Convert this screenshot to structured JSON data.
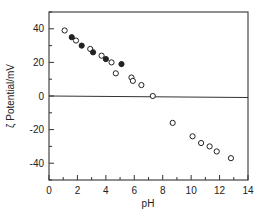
{
  "chart_data": {
    "type": "scatter",
    "title": "",
    "xlabel": "pH",
    "ylabel": "ζ Potential/mV",
    "xlim": [
      0,
      14
    ],
    "ylim": [
      -50,
      50
    ],
    "xticks": [
      0,
      2,
      4,
      6,
      8,
      10,
      12,
      14
    ],
    "yticks": [
      -40,
      -20,
      0,
      20,
      40
    ],
    "x_minor_step": 1,
    "y_minor_step": 10,
    "grid": false,
    "reference_line": {
      "y": 0
    },
    "legend": null,
    "series": [
      {
        "name": "open circles",
        "marker": "open-circle",
        "points": [
          {
            "x": 1.1,
            "y": 39
          },
          {
            "x": 1.9,
            "y": 33
          },
          {
            "x": 2.9,
            "y": 28
          },
          {
            "x": 3.7,
            "y": 24
          },
          {
            "x": 4.4,
            "y": 20
          },
          {
            "x": 4.7,
            "y": 13.5
          },
          {
            "x": 5.8,
            "y": 11
          },
          {
            "x": 5.9,
            "y": 9
          },
          {
            "x": 6.5,
            "y": 6.5
          },
          {
            "x": 7.3,
            "y": 0
          },
          {
            "x": 8.7,
            "y": -16
          },
          {
            "x": 10.1,
            "y": -24
          },
          {
            "x": 10.7,
            "y": -28
          },
          {
            "x": 11.3,
            "y": -30
          },
          {
            "x": 11.8,
            "y": -33
          },
          {
            "x": 12.8,
            "y": -37
          }
        ]
      },
      {
        "name": "filled circles",
        "marker": "filled-circle",
        "points": [
          {
            "x": 1.6,
            "y": 35
          },
          {
            "x": 2.3,
            "y": 30
          },
          {
            "x": 3.1,
            "y": 26
          },
          {
            "x": 4.0,
            "y": 22
          },
          {
            "x": 5.1,
            "y": 19
          }
        ]
      }
    ]
  },
  "colors": {
    "axis": "#333333",
    "marker": "#222222",
    "background": "#ffffff"
  }
}
